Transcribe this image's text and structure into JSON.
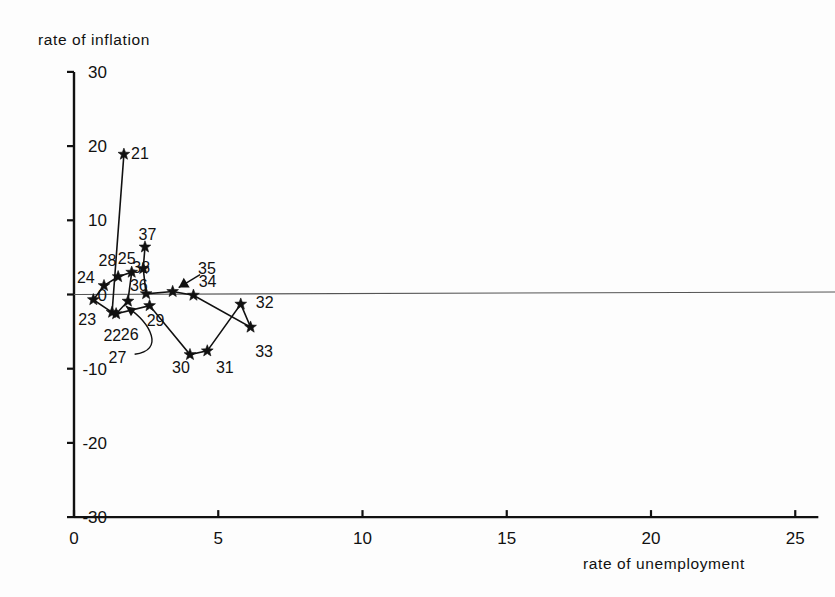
{
  "chart_data": {
    "type": "scatter",
    "title": "",
    "xlabel": "rate of unemployment",
    "ylabel": "rate of inflation",
    "xlim": [
      0,
      25.8
    ],
    "ylim": [
      -30,
      30
    ],
    "xticks": [
      0,
      5,
      10,
      15,
      20,
      25
    ],
    "yticks": [
      30,
      20,
      10,
      0,
      -10,
      -20,
      -30
    ],
    "xtick_labels": [
      "0",
      "5",
      "10",
      "15",
      "20",
      "25"
    ],
    "ytick_labels": [
      "30",
      "20",
      "10",
      "0",
      "-10",
      "-20",
      "-30"
    ],
    "grid": false,
    "legend": "none",
    "marker": "star",
    "connected": true,
    "zero_line": true,
    "points": [
      {
        "label": "21",
        "x": 1.73,
        "y": 18.9,
        "lx": 1.98,
        "ly": 18.9,
        "leader": false
      },
      {
        "label": "22",
        "x": 1.32,
        "y": -2.4,
        "lx": 1.02,
        "ly": -5.6,
        "leader": false
      },
      {
        "label": "23",
        "x": 0.67,
        "y": -0.7,
        "lx": 0.15,
        "ly": -3.4,
        "leader": false
      },
      {
        "label": "24",
        "x": 1.04,
        "y": 1.2,
        "lx": 0.1,
        "ly": 2.2,
        "leader": false
      },
      {
        "label": "25",
        "x": 2.0,
        "y": 3.0,
        "lx": 1.52,
        "ly": 4.8,
        "leader": false
      },
      {
        "label": "26",
        "x": 1.46,
        "y": -2.6,
        "lx": 1.62,
        "ly": -5.5,
        "leader": false
      },
      {
        "label": "27",
        "x": 1.87,
        "y": -0.9,
        "lx": 1.2,
        "ly": -8.6,
        "leader": true
      },
      {
        "label": "28",
        "x": 1.53,
        "y": 2.4,
        "lx": 0.85,
        "ly": 4.5,
        "leader": false
      },
      {
        "label": "29",
        "x": 2.62,
        "y": -1.5,
        "lx": 2.52,
        "ly": -3.6,
        "leader": false
      },
      {
        "label": "30",
        "x": 4.02,
        "y": -8.1,
        "lx": 3.4,
        "ly": -9.9,
        "leader": false
      },
      {
        "label": "31",
        "x": 4.62,
        "y": -7.6,
        "lx": 4.92,
        "ly": -9.9,
        "leader": false
      },
      {
        "label": "32",
        "x": 5.78,
        "y": -1.3,
        "lx": 6.3,
        "ly": -1.2,
        "leader": false
      },
      {
        "label": "33",
        "x": 6.12,
        "y": -4.4,
        "lx": 6.28,
        "ly": -7.7,
        "leader": false
      },
      {
        "label": "34",
        "x": 4.14,
        "y": -0.1,
        "lx": 4.32,
        "ly": 1.7,
        "leader": false
      },
      {
        "label": "35",
        "x": 3.42,
        "y": 0.4,
        "lx": 4.3,
        "ly": 3.5,
        "leader": true
      },
      {
        "label": "36",
        "x": 2.5,
        "y": 0.1,
        "lx": 1.94,
        "ly": 1.1,
        "leader": false
      },
      {
        "label": "37",
        "x": 2.46,
        "y": 6.4,
        "lx": 2.24,
        "ly": 8.0,
        "leader": false
      },
      {
        "label": "38",
        "x": 2.4,
        "y": 3.5,
        "lx": 2.02,
        "ly": 3.6,
        "leader": false
      }
    ],
    "path_order": [
      "21",
      "22",
      "23",
      "24",
      "28",
      "25",
      "27",
      "26",
      "29",
      "30",
      "31",
      "32",
      "33",
      "34",
      "35",
      "36",
      "38",
      "37"
    ],
    "colors": {
      "ink": "#111111",
      "background": "#fdfdfd",
      "zero_line": "#444444"
    }
  }
}
